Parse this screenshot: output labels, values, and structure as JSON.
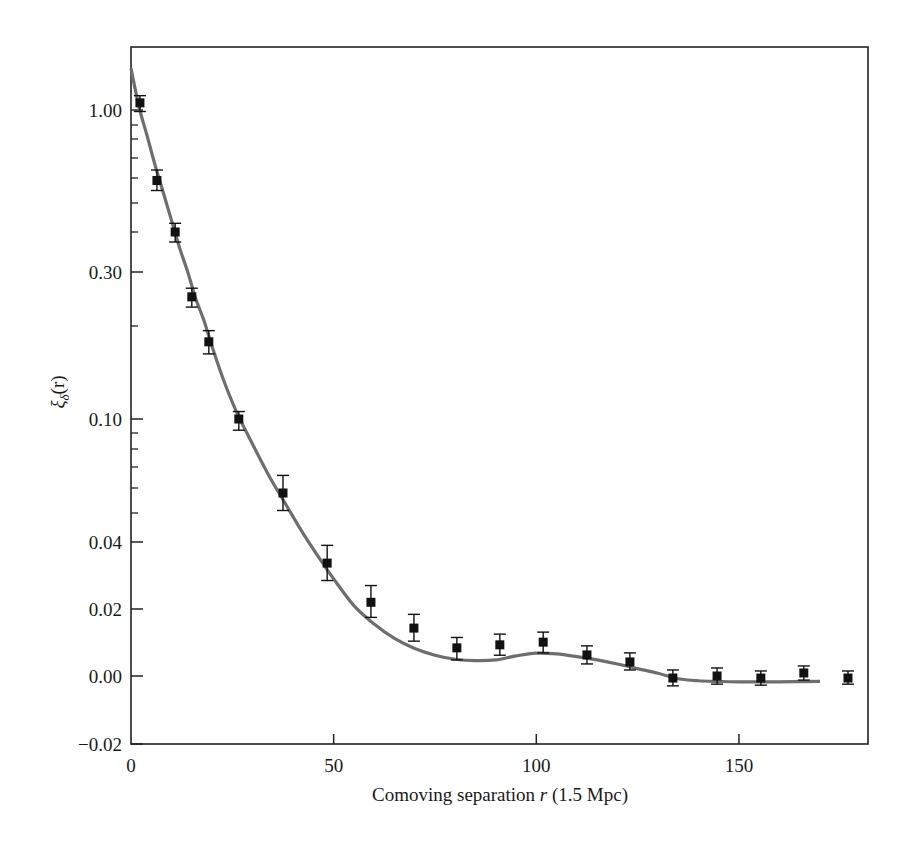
{
  "chart_data": {
    "type": "scatter",
    "title": "",
    "xlabel": "Comoving separation r (1.5 Mpc)",
    "xlabel_parts": {
      "pre": "Comoving separation ",
      "var": "r",
      "post": " (1.5 Mpc)"
    },
    "ylabel": "ξδ(r)",
    "ylabel_parts": {
      "sym": "ξ",
      "sub": "δ",
      "arg": "(r)"
    },
    "xlim": [
      0,
      182
    ],
    "ylim": [
      -0.02,
      1.3
    ],
    "y_scale": "nonlinear (logarithmic upper region, linear near zero)",
    "grid": false,
    "legend": null,
    "x_ticks": [
      {
        "value": 0,
        "label": "0"
      },
      {
        "value": 50,
        "label": "50"
      },
      {
        "value": 100,
        "label": "100"
      },
      {
        "value": 150,
        "label": "150"
      }
    ],
    "y_ticks": [
      {
        "value": 1.0,
        "label": "1.00"
      },
      {
        "value": 0.3,
        "label": "0.30"
      },
      {
        "value": 0.1,
        "label": "0.10"
      },
      {
        "value": 0.04,
        "label": "0.04"
      },
      {
        "value": 0.02,
        "label": "0.02"
      },
      {
        "value": 0.0,
        "label": "0.00"
      },
      {
        "value": -0.02,
        "label": "−0.02"
      }
    ],
    "y_minor_ticks": [
      0.9,
      0.8,
      0.7,
      0.6,
      0.5,
      0.4,
      0.2,
      0.09,
      0.08,
      0.07,
      0.06,
      0.05
    ],
    "series": [
      {
        "name": "Measured correlation (data)",
        "type": "scatter-errorbar",
        "marker": "square",
        "color": "#111111",
        "points": [
          {
            "x": 2.2,
            "y": 1.05,
            "lo": 0.99,
            "hi": 1.1
          },
          {
            "x": 6.4,
            "y": 0.59,
            "lo": 0.55,
            "hi": 0.64
          },
          {
            "x": 10.9,
            "y": 0.4,
            "lo": 0.375,
            "hi": 0.43
          },
          {
            "x": 15.0,
            "y": 0.254,
            "lo": 0.235,
            "hi": 0.27
          },
          {
            "x": 19.2,
            "y": 0.183,
            "lo": 0.17,
            "hi": 0.195
          },
          {
            "x": 26.6,
            "y": 0.1,
            "lo": 0.092,
            "hi": 0.108
          },
          {
            "x": 37.5,
            "y": 0.058,
            "lo": 0.051,
            "hi": 0.066
          },
          {
            "x": 48.4,
            "y": 0.0337,
            "lo": 0.0285,
            "hi": 0.039
          },
          {
            "x": 59.2,
            "y": 0.022,
            "lo": 0.0175,
            "hi": 0.027
          },
          {
            "x": 69.8,
            "y": 0.0143,
            "lo": 0.0104,
            "hi": 0.0184
          },
          {
            "x": 80.4,
            "y": 0.0084,
            "lo": 0.0048,
            "hi": 0.0115
          },
          {
            "x": 91.0,
            "y": 0.0093,
            "lo": 0.0062,
            "hi": 0.0125
          },
          {
            "x": 101.7,
            "y": 0.0101,
            "lo": 0.0069,
            "hi": 0.0131
          },
          {
            "x": 112.5,
            "y": 0.0063,
            "lo": 0.0036,
            "hi": 0.009
          },
          {
            "x": 123.1,
            "y": 0.0042,
            "lo": 0.0018,
            "hi": 0.0069
          },
          {
            "x": 133.7,
            "y": -0.0006,
            "lo": -0.0029,
            "hi": 0.0018
          },
          {
            "x": 144.6,
            "y": 0.0,
            "lo": -0.0024,
            "hi": 0.0024
          },
          {
            "x": 155.4,
            "y": -0.0006,
            "lo": -0.0027,
            "hi": 0.0015
          },
          {
            "x": 166.0,
            "y": 0.0009,
            "lo": -0.0012,
            "hi": 0.003
          },
          {
            "x": 176.9,
            "y": -0.0006,
            "lo": -0.0024,
            "hi": 0.0015
          }
        ]
      },
      {
        "name": "Model fit",
        "type": "line",
        "color": "#6e6e6e",
        "x": [
          0,
          2,
          4,
          6,
          8,
          10,
          12,
          14,
          16,
          18,
          20,
          23,
          26,
          30,
          34,
          38,
          42,
          46,
          50,
          55,
          60,
          65,
          70,
          75,
          80,
          85,
          90,
          95,
          100,
          105,
          110,
          115,
          120,
          125,
          130,
          135,
          140,
          145,
          150,
          160,
          170,
          182
        ],
        "y": [
          1.29,
          1.02,
          0.82,
          0.66,
          0.54,
          0.44,
          0.36,
          0.3,
          0.25,
          0.21,
          0.178,
          0.14,
          0.108,
          0.083,
          0.066,
          0.054,
          0.044,
          0.036,
          0.029,
          0.021,
          0.0155,
          0.0112,
          0.0082,
          0.0062,
          0.005,
          0.0046,
          0.0048,
          0.006,
          0.0068,
          0.0066,
          0.0058,
          0.0048,
          0.0036,
          0.0022,
          0.0008,
          -0.0008,
          -0.0014,
          -0.0016,
          -0.0017,
          -0.0017,
          -0.0016,
          -0.0016
        ]
      }
    ]
  },
  "layout": {
    "plot_left": 131,
    "plot_right": 868,
    "plot_top": 47,
    "plot_bottom": 744,
    "x_px_per_unit": 4.053,
    "y_map": [
      [
        1.3,
        67
      ],
      [
        1.0,
        110
      ],
      [
        0.9,
        125
      ],
      [
        0.8,
        139
      ],
      [
        0.7,
        158
      ],
      [
        0.6,
        178
      ],
      [
        0.5,
        203
      ],
      [
        0.4,
        232
      ],
      [
        0.3,
        272
      ],
      [
        0.2,
        326
      ],
      [
        0.1,
        419
      ],
      [
        0.09,
        433
      ],
      [
        0.08,
        449
      ],
      [
        0.07,
        467
      ],
      [
        0.06,
        488
      ],
      [
        0.05,
        513
      ],
      [
        0.04,
        542
      ],
      [
        0.02,
        609
      ],
      [
        0.0,
        676
      ],
      [
        -0.02,
        744
      ]
    ]
  }
}
